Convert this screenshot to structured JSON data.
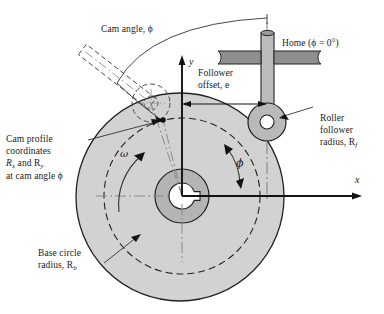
{
  "figure": {
    "type": "engineering-diagram"
  },
  "labels": {
    "cam_angle": "Cam angle, ϕ",
    "home": "Home (ϕ = 0°)",
    "follower_offset_l1": "Follower",
    "follower_offset_l2": "offset, e",
    "roller_l1": "Roller",
    "roller_l2": "follower",
    "roller_l3": "radius, R",
    "roller_sub": "f",
    "cam_profile_l1": "Cam profile",
    "cam_profile_l2": "coordinates",
    "cam_profile_l3a": "R",
    "cam_profile_l3a_sub": "x",
    "cam_profile_l3b": " and R",
    "cam_profile_l3b_sub": "y",
    "cam_profile_l4": "at cam angle ϕ",
    "base_circle_l1": "Base circle",
    "base_circle_l2": "radius, R",
    "base_circle_sub": "b",
    "axis_x": "x",
    "axis_y": "y",
    "omega": "ω",
    "phi": "ϕ"
  },
  "colors": {
    "cam_fill": "#d2d2d2",
    "hub_fill": "#b4b4b4",
    "bore_fill": "#ffffff",
    "roller_fill": "#b9b9b9",
    "rod_fill": "#bcbcbc",
    "guide_fill": "#8e8e8e",
    "outline": "#222222",
    "text": "#1a1a1a",
    "background": "#ffffff"
  },
  "geometry": {
    "cam_center_x": 182,
    "cam_center_y": 196,
    "cam_radius": 104,
    "base_circle_radius": 78,
    "hub_outer_radius": 27,
    "bore_radius": 13,
    "roller_center_x": 267,
    "roller_center_y": 122,
    "roller_outer_radius": 19,
    "roller_bore_radius": 7,
    "follower_offset_e": 85,
    "contact_point_x": 163,
    "contact_point_y": 120,
    "cam_angle_deg": 50
  }
}
